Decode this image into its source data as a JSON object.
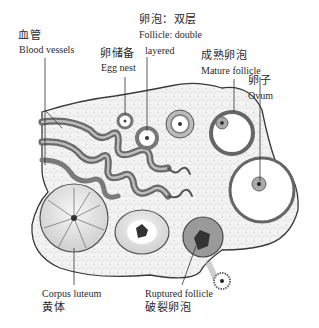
{
  "figure": {
    "colors": {
      "stroke": "#3a3a3a",
      "fill_stroma": "#f1f1f1",
      "vessel": "#7a7a7a",
      "follicle_ring": "#8c8c8c"
    }
  },
  "labels": {
    "blood_vessels": {
      "zh": "血管",
      "en": "Blood vessels"
    },
    "egg_nest": {
      "zh": "卵储备",
      "en": "Egg nest"
    },
    "follicle_double": {
      "zh": "卵泡：双层",
      "en_line1": "Follicle: double",
      "en_line2": "layered"
    },
    "mature_follicle": {
      "zh": "成熟卵泡",
      "en": "Mature follicle"
    },
    "ovum": {
      "zh": "卵子",
      "en": "Ovum"
    },
    "corpus_luteum": {
      "en": "Corpus luteum",
      "zh": "黄体"
    },
    "ruptured_follicle": {
      "en": "Ruptured follicle",
      "zh": "破裂卵泡"
    }
  }
}
